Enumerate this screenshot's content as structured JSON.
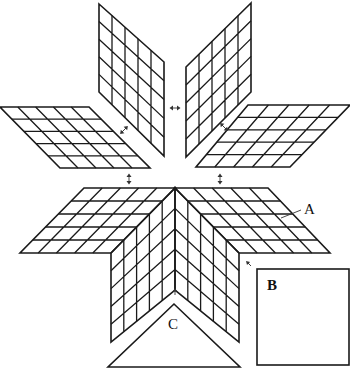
{
  "figure": {
    "colors": {
      "line": "#1a1a1a",
      "background": "#ffffff"
    }
  },
  "labels": {
    "a": "A",
    "b": "B",
    "c": "C"
  },
  "pieces": {
    "diamond_grid": {
      "rows": 5,
      "cols": 5
    },
    "detached_diamonds": [
      {
        "name": "top-left-diamond",
        "points": [
          [
            99,
            4
          ],
          [
            164,
            62
          ],
          [
            164,
            156
          ],
          [
            99,
            92
          ]
        ]
      },
      {
        "name": "top-right-diamond",
        "points": [
          [
            251,
            3
          ],
          [
            186,
            67
          ],
          [
            186,
            157
          ],
          [
            251,
            92
          ]
        ]
      },
      {
        "name": "left-diamond",
        "points": [
          [
            0,
            107
          ],
          [
            89,
            107
          ],
          [
            150,
            168
          ],
          [
            60,
            168
          ]
        ]
      },
      {
        "name": "right-diamond",
        "points": [
          [
            248,
            105
          ],
          [
            350,
            105
          ],
          [
            290,
            167
          ],
          [
            196,
            167
          ]
        ]
      }
    ],
    "square_b": {
      "x": 257,
      "y": 269,
      "w": 92,
      "h": 96
    },
    "triangle_c": {
      "points": [
        [
          174,
          304
        ],
        [
          108,
          367
        ],
        [
          240,
          367
        ]
      ]
    }
  },
  "arrows": [
    {
      "name": "double-arrow-top-center",
      "x": 175,
      "y": 108,
      "orient": "horizontal"
    },
    {
      "name": "double-arrow-top-left",
      "x": 124,
      "y": 130,
      "orient": "diag-ne"
    },
    {
      "name": "double-arrow-top-right",
      "x": 224,
      "y": 127,
      "orient": "diag-nw"
    },
    {
      "name": "double-arrow-mid-left",
      "x": 129,
      "y": 179,
      "orient": "vertical"
    },
    {
      "name": "double-arrow-mid-right",
      "x": 220,
      "y": 179,
      "orient": "vertical"
    },
    {
      "name": "arrow-to-square-b",
      "x": 248,
      "y": 263,
      "orient": "diag-nw-single"
    },
    {
      "name": "arrow-to-triangle-c",
      "x": 175,
      "y": 291,
      "orient": "up-single"
    }
  ]
}
